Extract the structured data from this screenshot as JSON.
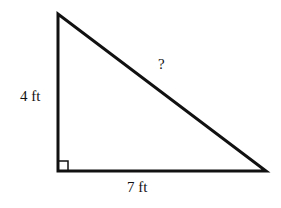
{
  "diagram": {
    "type": "right-triangle",
    "labels": {
      "vertical_leg": "4 ft",
      "horizontal_leg": "7 ft",
      "hypotenuse": "?"
    },
    "right_angle_marker": true,
    "stroke_color": "#111111",
    "background": "#ffffff"
  }
}
